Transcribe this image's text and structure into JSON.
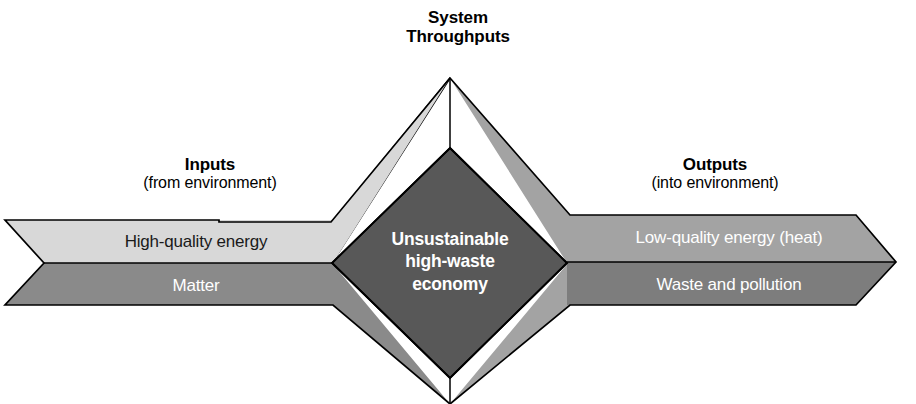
{
  "figure": {
    "title": "System Throughputs",
    "title_line1": "System",
    "title_line2": "Throughputs",
    "alt_caption": "Unsustainable high-waste economy system diagram"
  },
  "inputs": {
    "heading": "Inputs",
    "subheading": "(from environment)",
    "items": [
      {
        "label": "High-quality energy",
        "band": "upper",
        "text_color": "#1a1a1a",
        "fill": "#d8d8d8"
      },
      {
        "label": "Matter",
        "band": "lower",
        "text_color": "#ffffff",
        "fill": "#8a8a8a"
      }
    ]
  },
  "outputs": {
    "heading": "Outputs",
    "subheading": "(into environment)",
    "items": [
      {
        "label": "Low-quality energy (heat)",
        "band": "upper",
        "text_color": "#ffffff",
        "fill": "#a3a3a3"
      },
      {
        "label": "Waste and pollution",
        "band": "lower",
        "text_color": "#ffffff",
        "fill": "#7d7d7d"
      }
    ]
  },
  "core": {
    "line1": "Unsustainable",
    "line2": "high-waste",
    "line3": "economy",
    "fill": "#585858",
    "text_color": "#ffffff"
  },
  "throughput_arrows": {
    "top": {
      "left_face_fill": "#d8d8d8",
      "right_face_fill": "#a3a3a3"
    },
    "bottom": {
      "left_face_fill": "#8a8a8a",
      "right_face_fill": "#a3a3a3"
    }
  },
  "colors": {
    "background": "#ffffff",
    "outline": "#000000",
    "light_gray": "#d8d8d8",
    "mid_gray": "#a3a3a3",
    "dark_gray": "#8a8a8a",
    "darker_gray": "#7d7d7d",
    "core_gray": "#585858"
  }
}
